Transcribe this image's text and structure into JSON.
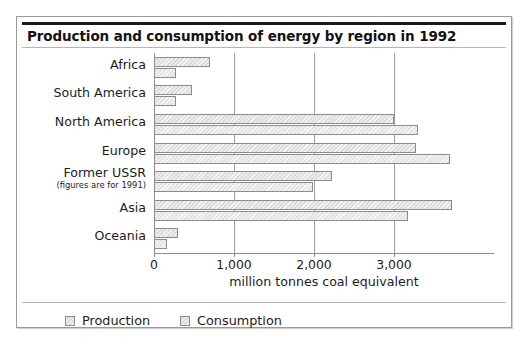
{
  "figure": {
    "title": "Production and consumption of energy by region in 1992"
  },
  "legend": {
    "items": [
      {
        "label": "Production",
        "swatch_name": "legend-swatch-production"
      },
      {
        "label": "Consumption",
        "swatch_name": "legend-swatch-consumption"
      }
    ]
  },
  "axis": {
    "x_title": "million tonnes coal equivalent",
    "tick_labels": [
      "0",
      "1,000",
      "2,000",
      "3,000"
    ]
  },
  "categories_display": [
    {
      "main": "Africa",
      "sub": ""
    },
    {
      "main": "South America",
      "sub": ""
    },
    {
      "main": "North America",
      "sub": ""
    },
    {
      "main": "Europe",
      "sub": ""
    },
    {
      "main": "Former USSR",
      "sub": "(figures are for 1991)"
    },
    {
      "main": "Asia",
      "sub": ""
    },
    {
      "main": "Oceania",
      "sub": ""
    }
  ],
  "chart_data": {
    "type": "bar",
    "orientation": "horizontal",
    "title": "Production and consumption of energy by region in 1992",
    "xlabel": "million tonnes coal equivalent",
    "ylabel": "",
    "xlim": [
      0,
      4000
    ],
    "xticks": [
      0,
      1000,
      2000,
      3000
    ],
    "grid": true,
    "legend_position": "bottom",
    "categories": [
      "Africa",
      "South America",
      "North America",
      "Europe",
      "Former USSR",
      "Asia",
      "Oceania"
    ],
    "series": [
      {
        "name": "Production",
        "values": [
          700,
          480,
          3000,
          3280,
          2220,
          3720,
          300
        ]
      },
      {
        "name": "Consumption",
        "values": [
          280,
          280,
          3300,
          3700,
          1990,
          3180,
          160
        ]
      }
    ],
    "annotations": [
      "Former USSR figures are for 1991"
    ]
  }
}
